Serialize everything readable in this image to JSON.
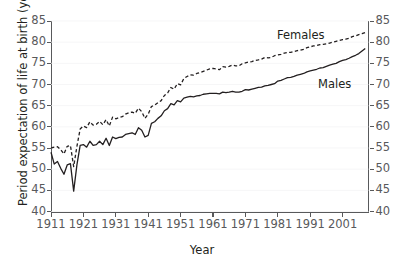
{
  "chart_data": {
    "type": "line",
    "title": "",
    "xlabel": "Year",
    "ylabel": "Period expectation of life at birth (years)",
    "xlim": [
      1911,
      2009
    ],
    "ylim": [
      40,
      85
    ],
    "xticks": [
      1911,
      1921,
      1931,
      1941,
      1951,
      1961,
      1971,
      1981,
      1991,
      2001
    ],
    "yticks": [
      40,
      45,
      50,
      55,
      60,
      65,
      70,
      75,
      80,
      85
    ],
    "grid": "faint-horizontal",
    "legend_position": "inline-annotations",
    "axes": {
      "left_axis_ticks": [
        40,
        45,
        50,
        55,
        60,
        65,
        70,
        75,
        80,
        85
      ],
      "right_axis_ticks": [
        40,
        45,
        50,
        55,
        60,
        65,
        70,
        75,
        80,
        85
      ]
    },
    "series": [
      {
        "name": "Females",
        "style": "dashed",
        "color": "#231f20",
        "annotation": "Females",
        "x": [
          1911,
          1912,
          1913,
          1914,
          1915,
          1916,
          1917,
          1918,
          1919,
          1920,
          1921,
          1922,
          1923,
          1924,
          1925,
          1926,
          1927,
          1928,
          1929,
          1930,
          1931,
          1932,
          1933,
          1934,
          1935,
          1936,
          1937,
          1938,
          1939,
          1940,
          1941,
          1942,
          1943,
          1944,
          1945,
          1946,
          1947,
          1948,
          1949,
          1950,
          1951,
          1952,
          1953,
          1954,
          1955,
          1956,
          1957,
          1958,
          1959,
          1960,
          1961,
          1962,
          1963,
          1964,
          1965,
          1966,
          1967,
          1968,
          1969,
          1970,
          1971,
          1972,
          1973,
          1974,
          1975,
          1976,
          1977,
          1978,
          1979,
          1980,
          1981,
          1982,
          1983,
          1984,
          1985,
          1986,
          1987,
          1988,
          1989,
          1990,
          1991,
          1992,
          1993,
          1994,
          1995,
          1996,
          1997,
          1998,
          1999,
          2000,
          2001,
          2002,
          2003,
          2004,
          2005,
          2006,
          2007,
          2008
        ],
        "values": [
          55.0,
          55.2,
          55.3,
          54.6,
          53.6,
          55.4,
          55.6,
          50.6,
          55.4,
          59.5,
          60.2,
          59.8,
          61.2,
          60.4,
          60.6,
          61.3,
          60.5,
          61.7,
          60.2,
          62.3,
          61.9,
          62.2,
          62.4,
          63.0,
          63.3,
          63.5,
          63.2,
          64.4,
          63.6,
          62.0,
          63.0,
          64.8,
          65.1,
          65.7,
          66.2,
          67.4,
          68.0,
          69.3,
          68.9,
          70.2,
          69.9,
          71.4,
          71.9,
          72.3,
          72.2,
          72.6,
          72.8,
          73.1,
          73.4,
          73.7,
          73.8,
          73.7,
          73.5,
          74.2,
          74.1,
          74.3,
          74.6,
          74.4,
          74.4,
          74.9,
          75.1,
          75.3,
          75.4,
          75.7,
          75.8,
          76.0,
          76.4,
          76.3,
          76.4,
          76.8,
          77.0,
          77.1,
          77.4,
          77.6,
          77.6,
          77.8,
          78.0,
          78.1,
          78.3,
          78.7,
          78.9,
          79.1,
          79.2,
          79.4,
          79.5,
          79.6,
          79.8,
          80.0,
          80.2,
          80.4,
          80.6,
          80.7,
          80.9,
          81.3,
          81.5,
          81.8,
          82.0,
          82.3
        ]
      },
      {
        "name": "Males",
        "style": "solid",
        "color": "#231f20",
        "annotation": "Males",
        "x": [
          1911,
          1912,
          1913,
          1914,
          1915,
          1916,
          1917,
          1918,
          1919,
          1920,
          1921,
          1922,
          1923,
          1924,
          1925,
          1926,
          1927,
          1928,
          1929,
          1930,
          1931,
          1932,
          1933,
          1934,
          1935,
          1936,
          1937,
          1938,
          1939,
          1940,
          1941,
          1942,
          1943,
          1944,
          1945,
          1946,
          1947,
          1948,
          1949,
          1950,
          1951,
          1952,
          1953,
          1954,
          1955,
          1956,
          1957,
          1958,
          1959,
          1960,
          1961,
          1962,
          1963,
          1964,
          1965,
          1966,
          1967,
          1968,
          1969,
          1970,
          1971,
          1972,
          1973,
          1974,
          1975,
          1976,
          1977,
          1978,
          1979,
          1980,
          1981,
          1982,
          1983,
          1984,
          1985,
          1986,
          1987,
          1988,
          1989,
          1990,
          1991,
          1992,
          1993,
          1994,
          1995,
          1996,
          1997,
          1998,
          1999,
          2000,
          2001,
          2002,
          2003,
          2004,
          2005,
          2006,
          2007,
          2008
        ],
        "values": [
          54.0,
          51.2,
          51.8,
          50.2,
          48.8,
          51.0,
          51.3,
          44.8,
          51.0,
          55.6,
          55.8,
          55.2,
          56.6,
          55.6,
          55.8,
          56.6,
          55.8,
          57.3,
          55.6,
          57.6,
          57.2,
          57.5,
          57.6,
          58.2,
          58.4,
          58.6,
          58.2,
          59.8,
          59.2,
          57.6,
          58.0,
          60.8,
          61.2,
          62.0,
          62.6,
          63.8,
          64.3,
          65.5,
          65.2,
          66.2,
          65.9,
          66.8,
          67.0,
          67.2,
          67.1,
          67.3,
          67.4,
          67.7,
          67.8,
          67.9,
          67.9,
          67.9,
          67.8,
          68.2,
          68.1,
          68.2,
          68.4,
          68.2,
          68.2,
          68.4,
          68.8,
          68.7,
          68.9,
          69.1,
          69.3,
          69.4,
          69.7,
          69.8,
          70.0,
          70.2,
          70.8,
          71.0,
          71.3,
          71.6,
          71.7,
          71.9,
          72.2,
          72.4,
          72.6,
          73.0,
          73.2,
          73.4,
          73.6,
          73.9,
          74.0,
          74.3,
          74.6,
          74.8,
          75.0,
          75.4,
          75.7,
          75.9,
          76.2,
          76.6,
          76.9,
          77.3,
          77.9,
          78.5
        ]
      }
    ]
  },
  "figure": {
    "ylabel": "Period expectation of life at birth (years)",
    "xlabel": "Year",
    "label_females": "Females",
    "label_males": "Males",
    "axis_color": "#58595b",
    "text_color": "#231f20",
    "line_color": "#231f20",
    "background": "#ffffff"
  }
}
